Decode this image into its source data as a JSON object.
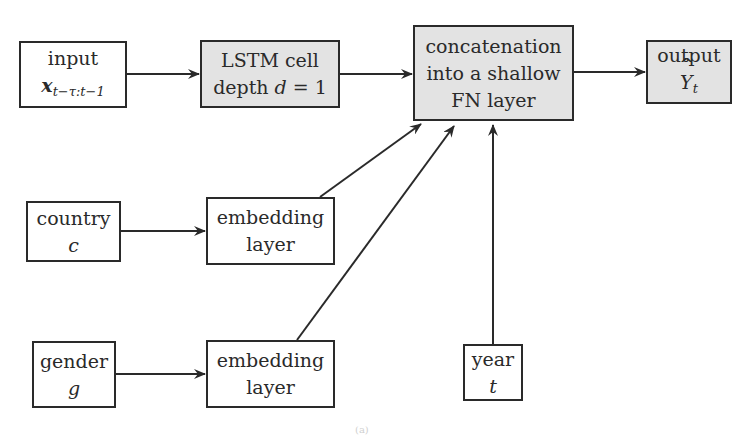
{
  "nodes": {
    "input": {
      "label": "input",
      "symbol": "x",
      "subscript": "t−τ:t−1",
      "shaded": false
    },
    "lstm": {
      "line1": "LSTM cell",
      "line2_prefix": "depth ",
      "line2_var": "d",
      "line2_suffix": " = 1",
      "shaded": true
    },
    "concat": {
      "line1": "concatenation",
      "line2": "into a shallow",
      "line3": "FN layer",
      "shaded": true
    },
    "output": {
      "label": "output",
      "symbol": "Y",
      "subscript": "t",
      "shaded": true
    },
    "country": {
      "label": "country",
      "symbol": "c",
      "shaded": false
    },
    "embedding_country": {
      "line1": "embedding",
      "line2": "layer",
      "shaded": false
    },
    "gender": {
      "label": "gender",
      "symbol": "g",
      "shaded": false
    },
    "embedding_gender": {
      "line1": "embedding",
      "line2": "layer",
      "shaded": false
    },
    "year": {
      "label": "year",
      "symbol": "t",
      "shaded": false
    }
  },
  "edges": [
    {
      "from": "input",
      "to": "lstm"
    },
    {
      "from": "lstm",
      "to": "concat"
    },
    {
      "from": "concat",
      "to": "output"
    },
    {
      "from": "country",
      "to": "embedding_country"
    },
    {
      "from": "gender",
      "to": "embedding_gender"
    },
    {
      "from": "embedding_country",
      "to": "concat"
    },
    {
      "from": "embedding_gender",
      "to": "concat"
    },
    {
      "from": "year",
      "to": "concat"
    }
  ],
  "caption": "(a)",
  "colors": {
    "stroke": "#2a2a2a",
    "shaded_fill": "#e3e3e3",
    "background": "#ffffff"
  }
}
